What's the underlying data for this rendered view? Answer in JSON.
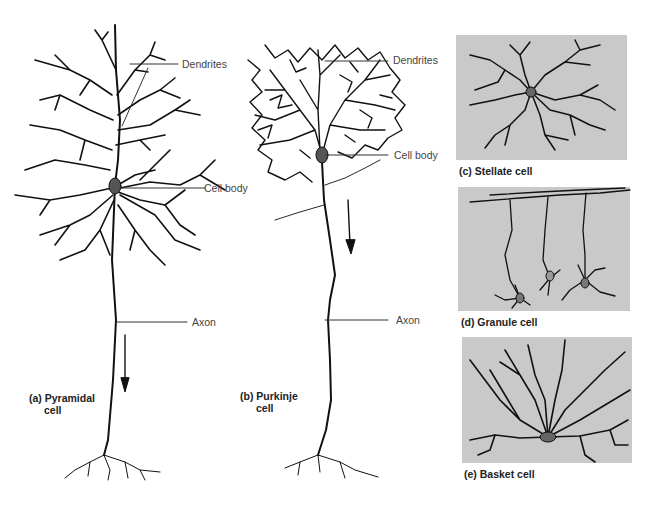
{
  "figure": {
    "panels": [
      {
        "id": "a",
        "caption_line1": "(a) Pyramidal",
        "caption_line2": "cell"
      },
      {
        "id": "b",
        "caption_line1": "(b) Purkinje",
        "caption_line2": "cell"
      },
      {
        "id": "c",
        "caption": "(c) Stellate cell"
      },
      {
        "id": "d",
        "caption": "(d) Granule cell"
      },
      {
        "id": "e",
        "caption": "(e) Basket cell"
      }
    ],
    "labels": {
      "pyramidal_dendrites": "Dendrites",
      "pyramidal_cell_body": "Cell body",
      "pyramidal_axon": "Axon",
      "purkinje_dendrites": "Dendrites",
      "purkinje_cell_body": "Cell body",
      "purkinje_axon": "Axon"
    },
    "colors": {
      "panel_gray": "#c9c9c9",
      "ink": "#111111",
      "label": "#444444"
    }
  }
}
